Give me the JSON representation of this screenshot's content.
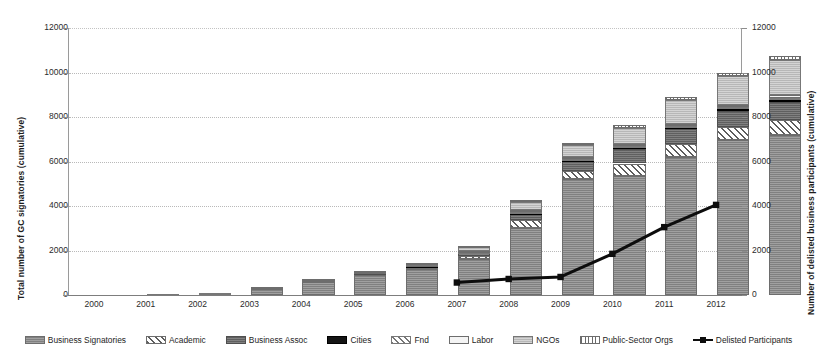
{
  "chart_data": {
    "type": "bar",
    "stacked": true,
    "title": "",
    "xlabel": "",
    "ylabel": "Total number of GC signatories (cumulative)",
    "y2label": "Number of delisted business participants (cumulative)",
    "categories": [
      "2000",
      "2001",
      "2002",
      "2003",
      "2004",
      "2005",
      "2006",
      "2007",
      "2008",
      "2009",
      "2010",
      "2011",
      "2012"
    ],
    "ylim": [
      0,
      12000
    ],
    "y2lim": [
      0,
      12000
    ],
    "yticks": [
      "0",
      "2000",
      "4000",
      "6000",
      "8000",
      "10000",
      "12000"
    ],
    "y2ticks": [
      "0",
      "2000",
      "4000",
      "6000",
      "8000",
      "10000",
      "12000"
    ],
    "grid": true,
    "legend_position": "bottom",
    "series": [
      {
        "name": "Business Signatories",
        "key": "bizsig",
        "values": [
          40,
          90,
          290,
          620,
          930,
          1180,
          1620,
          3000,
          5200,
          5350,
          6200,
          6950,
          7200
        ]
      },
      {
        "name": "Academic",
        "key": "academic",
        "values": [
          2,
          4,
          12,
          22,
          35,
          55,
          120,
          350,
          380,
          560,
          580,
          600,
          680
        ]
      },
      {
        "name": "Business Assoc",
        "key": "bizassoc",
        "values": [
          3,
          4,
          20,
          30,
          45,
          70,
          150,
          300,
          430,
          650,
          680,
          740,
          800
        ]
      },
      {
        "name": "Cities",
        "key": "cities",
        "values": [
          1,
          1,
          3,
          5,
          8,
          12,
          25,
          50,
          60,
          70,
          80,
          90,
          100
        ]
      },
      {
        "name": "Fnd",
        "key": "fnd",
        "values": [
          1,
          1,
          3,
          5,
          8,
          11,
          20,
          40,
          50,
          60,
          70,
          80,
          90
        ]
      },
      {
        "name": "Labor",
        "key": "labor",
        "values": [
          1,
          2,
          5,
          8,
          12,
          16,
          30,
          60,
          70,
          80,
          90,
          100,
          110
        ]
      },
      {
        "name": "NGOs",
        "key": "ngos",
        "values": [
          2,
          3,
          15,
          25,
          40,
          60,
          180,
          380,
          550,
          740,
          1050,
          1280,
          1560
        ]
      },
      {
        "name": "Public-Sector Orgs",
        "key": "public",
        "values": [
          0,
          0,
          2,
          5,
          10,
          16,
          35,
          70,
          90,
          110,
          130,
          160,
          200
        ]
      }
    ],
    "line_series": {
      "name": "Delisted Participants",
      "axis": "right",
      "values": [
        null,
        null,
        null,
        null,
        null,
        null,
        null,
        560,
        720,
        810,
        1850,
        3050,
        4050
      ],
      "color": "#0d0d0d"
    },
    "totals": [
      50,
      105,
      350,
      720,
      1088,
      1420,
      2180,
      4250,
      6830,
      7620,
      8880,
      10000,
      10740
    ]
  },
  "legend": {
    "items": [
      {
        "label": "Business Signatories",
        "key": "bizsig"
      },
      {
        "label": "Academic",
        "key": "academic"
      },
      {
        "label": "Business Assoc",
        "key": "bizassoc"
      },
      {
        "label": "Cities",
        "key": "cities"
      },
      {
        "label": "Fnd",
        "key": "fnd"
      },
      {
        "label": "Labor",
        "key": "labor"
      },
      {
        "label": "NGOs",
        "key": "ngos"
      },
      {
        "label": "Public-Sector Orgs",
        "key": "public"
      },
      {
        "label": "Delisted Participants",
        "key": "delisted"
      }
    ]
  },
  "colors": {
    "business_signatories": "#8e8e8e",
    "business_assoc": "#6f6f6f",
    "cities": "#141414",
    "ngos": "#c2c2c2",
    "delisted_line": "#0d0d0d",
    "gridline": "#b9b9b9",
    "axis": "#7d7d7d"
  }
}
